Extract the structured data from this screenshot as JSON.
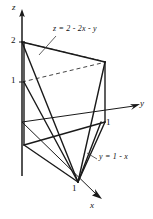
{
  "figure": {
    "kind": "3d-solid-region",
    "line_color": "#1a1a1a",
    "background_color": "#ffffff",
    "dash_color": "#555555"
  },
  "axes": [
    {
      "id": "z",
      "label": "z",
      "label_x": 13,
      "label_y": 5
    },
    {
      "id": "y",
      "label": "y",
      "label_x": 140,
      "label_y": 100
    },
    {
      "id": "x",
      "label": "x",
      "label_x": 90,
      "label_y": 202
    }
  ],
  "ticks": [
    {
      "axis": "z",
      "value": "2",
      "x": 11,
      "y": 36
    },
    {
      "axis": "z",
      "value": "1",
      "x": 11,
      "y": 80
    },
    {
      "axis": "y",
      "value": "1",
      "x": 106,
      "y": 120
    },
    {
      "axis": "x",
      "value": "1",
      "x": 72,
      "y": 186
    }
  ],
  "annotations": [
    {
      "id": "plane-equation",
      "text": "z = 2 - 2x - y",
      "x": 52,
      "y": 26,
      "leader": {
        "x1": 55,
        "y1": 36,
        "x2": 41,
        "y2": 52
      }
    },
    {
      "id": "base-line-equation",
      "text": "y = 1 - x",
      "x": 98,
      "y": 155,
      "leader": {
        "x1": 97,
        "y1": 160,
        "x2": 88,
        "y2": 155
      }
    }
  ],
  "vertices": {
    "origin": {
      "x": 22,
      "y": 122
    },
    "z_two": {
      "x": 22,
      "y": 42
    },
    "z_one": {
      "x": 22,
      "y": 82
    },
    "back_left_base": {
      "x": 22,
      "y": 145
    },
    "right_top": {
      "x": 105,
      "y": 62
    },
    "right_bottom": {
      "x": 105,
      "y": 122
    },
    "front_apex": {
      "x": 78,
      "y": 182
    },
    "z_arrow_tip": {
      "x": 22,
      "y": 10
    },
    "y_arrow_tip": {
      "x": 139,
      "y": 104
    },
    "x_arrow_tip": {
      "x": 101,
      "y": 198
    }
  }
}
